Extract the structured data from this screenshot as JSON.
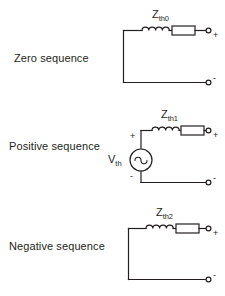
{
  "diagram": {
    "background_color": "#ffffff",
    "line_color": "#231f20"
  },
  "networks": [
    {
      "id": "zero-sequence",
      "label": "Zero sequence",
      "impedance_label": "Z",
      "impedance_subscript": "th0",
      "has_source": false,
      "terminal_positive": "+",
      "terminal_negative": "-",
      "components": [
        "inductor",
        "resistor"
      ]
    },
    {
      "id": "positive-sequence",
      "label": "Positive sequence",
      "impedance_label": "Z",
      "impedance_subscript": "th1",
      "has_source": true,
      "source_label": "V",
      "source_subscript": "th",
      "source_type": "ac-sine",
      "source_positive": "+",
      "source_negative": "-",
      "terminal_positive": "+",
      "terminal_negative": "-",
      "components": [
        "voltage-source",
        "inductor",
        "resistor"
      ]
    },
    {
      "id": "negative-sequence",
      "label": "Negative sequence",
      "impedance_label": "Z",
      "impedance_subscript": "th2",
      "has_source": false,
      "terminal_positive": "+",
      "terminal_negative": "-",
      "components": [
        "inductor",
        "resistor"
      ]
    }
  ]
}
